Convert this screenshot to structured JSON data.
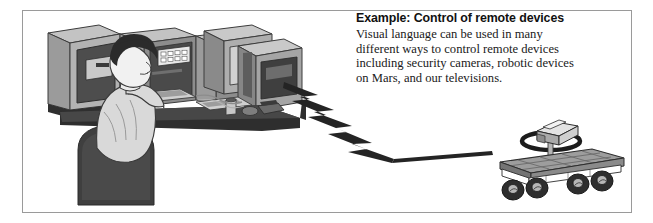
{
  "figure": {
    "title": "Example: Control of remote devices",
    "border_color": "#9a9a9a",
    "background": "#ffffff"
  },
  "caption": {
    "heading": "Example: Control of remote devices",
    "body_lines": [
      "Visual language can be used in many",
      "different ways to control remote devices",
      "including security cameras, robotic devices",
      "on Mars, and our televisions."
    ]
  },
  "illustration": {
    "scene_name": "operator-at-control-console-commanding-mars-rover",
    "operator": {
      "label": "seated operator",
      "hair_color": "#2b2b2b",
      "skin_color": "#f2f2f2",
      "clothing_color": "#d6d6d6",
      "chair_color": "#4a4a4a"
    },
    "console": {
      "label": "control console with monitors",
      "monitor_count": 3,
      "screen_color": "#c9c9c9",
      "cabinet_color": "#8f8f8f",
      "desk_color": "#3a3a3a",
      "button_panel": {
        "label": "indicator button panel",
        "rows": 2,
        "columns": 5,
        "button_color": "#ffffff"
      }
    },
    "signal": {
      "label": "wireless signal bolt",
      "shape": "lightning-zigzag",
      "color": "#262626",
      "from": "console monitors",
      "to": "remote rover"
    },
    "rover": {
      "label": "remote rover on Mars",
      "deck_color": "#9d9d9d",
      "wheel_count": 4,
      "wheel_color": "#2e2e2e",
      "camera": {
        "label": "camera head on mast",
        "mast_color": "#a8a8a8",
        "ring_color": "#1c1c1c"
      }
    }
  }
}
